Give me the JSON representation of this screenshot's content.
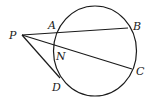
{
  "figure": {
    "type": "geometry",
    "circle": {
      "cx": 95,
      "cy": 51,
      "rx": 41.5,
      "ry": 45
    },
    "points": {
      "P": {
        "x": 22,
        "y": 35
      },
      "A": {
        "x": 56,
        "y": 31
      },
      "B": {
        "x": 128,
        "y": 28
      },
      "N": {
        "x": 54,
        "y": 43
      },
      "C": {
        "x": 132,
        "y": 69
      },
      "D": {
        "x": 60,
        "y": 77
      }
    },
    "segments": [
      {
        "name": "secant-PB",
        "from": "P",
        "to": "B"
      },
      {
        "name": "secant-PC",
        "from": "P",
        "to": "C"
      },
      {
        "name": "tangent-PD",
        "from": "P",
        "to": "D"
      }
    ],
    "labels": {
      "P": "P",
      "A": "A",
      "B": "B",
      "N": "N",
      "C": "C",
      "D": "D"
    }
  }
}
